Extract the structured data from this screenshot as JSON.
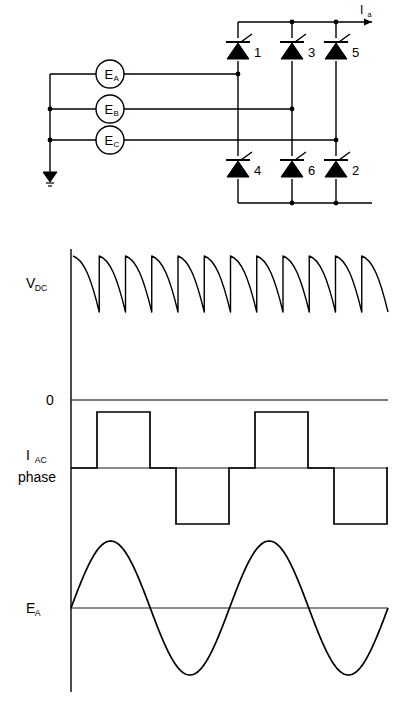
{
  "figure": {
    "line_color": "#000000",
    "background": "#ffffff"
  },
  "circuit": {
    "sources": [
      {
        "id": "ea",
        "label": "E",
        "sub": "A",
        "cx": 110,
        "cy": 74,
        "r": 14
      },
      {
        "id": "eb",
        "label": "E",
        "sub": "B",
        "cx": 110,
        "cy": 109,
        "r": 14
      },
      {
        "id": "ec",
        "label": "E",
        "sub": "C",
        "cx": 110,
        "cy": 140,
        "r": 14
      }
    ],
    "thyristors": [
      {
        "id": "t1",
        "number": "1",
        "x": 238,
        "y": 50,
        "row": "top"
      },
      {
        "id": "t3",
        "number": "3",
        "x": 292,
        "y": 50,
        "row": "top"
      },
      {
        "id": "t5",
        "number": "5",
        "x": 336,
        "y": 50,
        "row": "top"
      },
      {
        "id": "t4",
        "number": "4",
        "x": 238,
        "y": 168,
        "row": "bottom"
      },
      {
        "id": "t6",
        "number": "6",
        "x": 292,
        "y": 168,
        "row": "bottom"
      },
      {
        "id": "t2",
        "number": "2",
        "x": 336,
        "y": 168,
        "row": "bottom"
      }
    ],
    "output_current": {
      "label": "I",
      "sub": "a"
    },
    "ground_label": "",
    "neutral_bus_x": 50
  },
  "waveforms": {
    "axis": {
      "x": 71,
      "top": 249,
      "bottom": 692
    },
    "vdc": {
      "label": "V",
      "sub": "DC",
      "baseline_y": 400,
      "peak_y": 256,
      "trough_y": 312,
      "x_start": 73,
      "x_end": 388,
      "humps": 12,
      "zero_label": "0"
    },
    "iac": {
      "label": "I",
      "sub": "AC",
      "label2": "phase",
      "baseline_y": 468,
      "high_y": 412,
      "low_y": 524,
      "x_start": 71,
      "x_end": 388,
      "period": 158,
      "pulse_width": 53,
      "segments": [
        {
          "level": 0,
          "x0": 71,
          "x1": 97
        },
        {
          "level": 1,
          "x0": 97,
          "x1": 150
        },
        {
          "level": 0,
          "x0": 150,
          "x1": 176
        },
        {
          "level": -1,
          "x0": 176,
          "x1": 229
        },
        {
          "level": 0,
          "x0": 229,
          "x1": 255
        },
        {
          "level": 1,
          "x0": 255,
          "x1": 308
        },
        {
          "level": 0,
          "x0": 308,
          "x1": 334
        },
        {
          "level": -1,
          "x0": 334,
          "x1": 387
        },
        {
          "level": 0,
          "x0": 387,
          "x1": 388
        }
      ]
    },
    "ea": {
      "label": "E",
      "sub": "A",
      "baseline_y": 608,
      "amplitude": 67,
      "x_start": 71,
      "x_end": 388,
      "cycles": 2
    }
  }
}
